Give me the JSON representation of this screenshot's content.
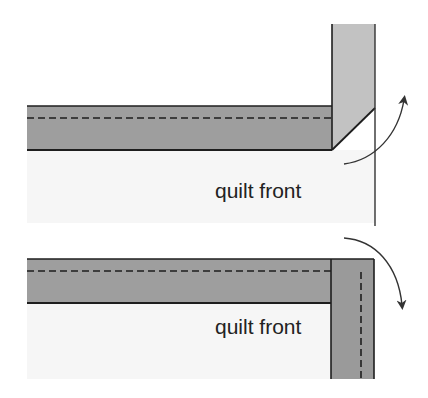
{
  "diagram": {
    "panels": [
      {
        "id": "top",
        "label": "quilt front",
        "step": "fold binding up at 45-degree angle",
        "arrow_direction": "up"
      },
      {
        "id": "bottom",
        "label": "quilt front",
        "step": "fold binding down along edge",
        "arrow_direction": "down"
      }
    ],
    "colors": {
      "binding_dark": "#9a9a9a",
      "binding_light": "#bdbdbd",
      "quilt_front": "#f6f6f6",
      "outline": "#1e1e1e",
      "arrow": "#333333"
    }
  }
}
